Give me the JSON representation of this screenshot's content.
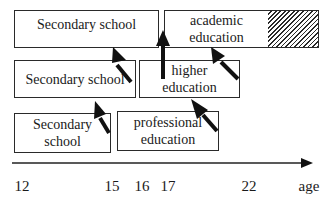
{
  "diagram": {
    "type": "education-pathway-timeline",
    "boxes": [
      {
        "id": "secondary-school-top",
        "label": "Secondary school"
      },
      {
        "id": "academic-education",
        "label": "academic\neducation",
        "line1": "academic",
        "line2": "education"
      },
      {
        "id": "secondary-school-mid",
        "label": "Secondary school"
      },
      {
        "id": "higher-education",
        "label": "higher\neducation",
        "line1": "higher",
        "line2": "education"
      },
      {
        "id": "secondary-school-bottom",
        "label": "Secondary\nschool",
        "line1": "Secondary",
        "line2": "school"
      },
      {
        "id": "professional-education",
        "label": "professional\neducation",
        "line1": "professional",
        "line2": "education"
      }
    ],
    "axis": {
      "ticks": [
        "12",
        "15",
        "16",
        "17",
        "22"
      ],
      "label": "age"
    },
    "arrows": [
      {
        "from": "secondary-school-mid",
        "to": "secondary-school-top",
        "style": "diagonal"
      },
      {
        "from": "higher-education",
        "to": "academic-education",
        "style": "vertical"
      },
      {
        "from": "higher-education",
        "to": "academic-education",
        "style": "diagonal"
      },
      {
        "from": "secondary-school-bottom",
        "to": "secondary-school-mid",
        "style": "diagonal"
      },
      {
        "from": "professional-education",
        "to": "higher-education",
        "style": "diagonal"
      }
    ],
    "hatched_region": "academic-education continuation beyond age 22"
  }
}
